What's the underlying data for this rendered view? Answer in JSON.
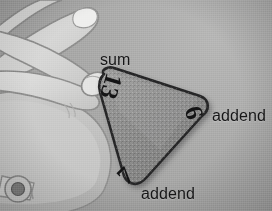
{
  "image": {
    "kind": "photo-illustration",
    "subject": "hand holding a triangular math fact-family flash card",
    "background_color": "#a9a9a6",
    "palette": {
      "background": "#a9a9a6",
      "card_fill": "#8a8a88",
      "card_outline": "#2b2b2d",
      "hand_fill": "#d8d8d4",
      "hand_outline": "#8e8e8b",
      "text": "#16161a"
    }
  },
  "card": {
    "name": "fact-triangle-card",
    "shape": "rounded-triangle",
    "sum": "13",
    "addend_right": "6",
    "addend_bottom": "7",
    "fact_family": "6 + 7 = 13"
  },
  "labels": {
    "sum": "sum",
    "addend_right": "addend",
    "addend_bottom": "addend"
  },
  "hand": {
    "description": "line-drawn hand, thumb and fingers pinching the top corner of the card",
    "wrist_ornament": "flower-button"
  }
}
